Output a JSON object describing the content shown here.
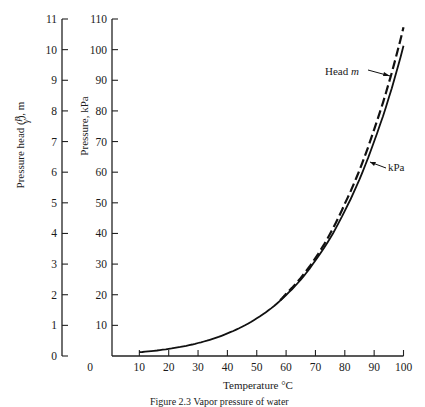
{
  "chart_data": {
    "type": "line",
    "title": "",
    "xlabel": "Temperature °C",
    "ylabel_left": "Pressure head (p/γ), m",
    "ylabel_right": "Pressure, kPa",
    "x_ticks": [
      0,
      10,
      20,
      30,
      40,
      50,
      60,
      70,
      80,
      90,
      100
    ],
    "head_ticks": [
      0,
      1,
      2,
      3,
      4,
      5,
      6,
      7,
      8,
      9,
      10,
      11
    ],
    "kpa_ticks": [
      10,
      20,
      30,
      40,
      50,
      60,
      70,
      80,
      90,
      100,
      110
    ],
    "xlim": [
      0,
      100
    ],
    "ylim_kpa": [
      0,
      110
    ],
    "ylim_head": [
      0,
      11
    ],
    "grid": false,
    "series": [
      {
        "name": "kPa",
        "style": "solid",
        "x": [
          10,
          20,
          30,
          40,
          50,
          60,
          70,
          80,
          90,
          100
        ],
        "values": [
          1.23,
          2.34,
          4.24,
          7.38,
          12.3,
          19.9,
          31.2,
          47.4,
          70.1,
          101.3
        ]
      },
      {
        "name": "Head m",
        "style": "dashed",
        "x": [
          58,
          60,
          70,
          80,
          90,
          100
        ],
        "values": [
          1.82,
          2.03,
          3.2,
          4.97,
          7.4,
          10.73
        ]
      }
    ],
    "annotations": [
      {
        "text": "Head ",
        "italic_suffix": "m",
        "points_to": "Head m"
      },
      {
        "text": "kPa",
        "points_to": "kPa"
      }
    ]
  },
  "labels": {
    "xlabel": "Temperature °C",
    "head_label_prefix": "Pressure head (",
    "head_label_p": "p",
    "head_label_gamma": "γ",
    "head_label_suffix": "), m",
    "kpa_label": "Pressure, kPa",
    "ann_head": "Head ",
    "ann_head_m": "m",
    "ann_kpa": "kPa",
    "caption": "Figure 2.3   Vapor pressure of water"
  }
}
